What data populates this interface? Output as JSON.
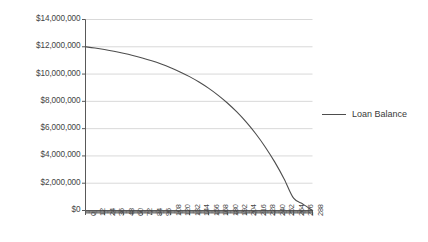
{
  "chart_data": {
    "type": "line",
    "title": "",
    "subtitle": "",
    "xlabel": "",
    "ylabel": "",
    "grid": "horizontal",
    "legend_position": "right",
    "ylim": [
      0,
      14000000
    ],
    "ytick_step": 2000000,
    "ytick_labels": [
      "$14,000,000",
      "$12,000,000",
      "$10,000,000",
      "$8,000,000",
      "$6,000,000",
      "$4,000,000",
      "$2,000,000",
      "$0"
    ],
    "ytick_values": [
      14000000,
      12000000,
      10000000,
      8000000,
      6000000,
      4000000,
      2000000,
      0
    ],
    "xlim": [
      0,
      288
    ],
    "xtick_step": 12,
    "xtick_labels": [
      "0",
      "12",
      "24",
      "36",
      "48",
      "60",
      "72",
      "84",
      "96",
      "108",
      "120",
      "132",
      "144",
      "156",
      "168",
      "180",
      "192",
      "204",
      "216",
      "228",
      "240",
      "252",
      "264",
      "276",
      "288"
    ],
    "xtick_values": [
      0,
      12,
      24,
      36,
      48,
      60,
      72,
      84,
      96,
      108,
      120,
      132,
      144,
      156,
      168,
      180,
      192,
      204,
      216,
      228,
      240,
      252,
      264,
      276,
      288
    ],
    "minor_tick_step": 1,
    "series": [
      {
        "name": "Loan Balance",
        "color": "#4d4d4d",
        "x": [
          0,
          12,
          24,
          36,
          48,
          60,
          72,
          84,
          96,
          108,
          120,
          132,
          144,
          156,
          168,
          180,
          192,
          204,
          216,
          228,
          240,
          252,
          264,
          276,
          288
        ],
        "values": [
          12000000,
          11905000,
          11795000,
          11670000,
          11528000,
          11366000,
          11182000,
          10973000,
          10736000,
          10466000,
          10160000,
          9812000,
          9417000,
          8968000,
          8458000,
          7879000,
          7221000,
          6473000,
          5624000,
          4659000,
          3563000,
          2317000,
          902000,
          470000,
          0
        ]
      }
    ],
    "annotations": []
  },
  "legend": {
    "items": [
      {
        "label": "Loan Balance",
        "color": "#4d4d4d"
      }
    ]
  },
  "axis_style": {
    "gridline_color": "#d9d9d9",
    "axis_color": "#595959",
    "plot_background": "#ffffff"
  }
}
